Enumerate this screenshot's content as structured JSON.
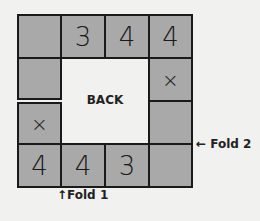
{
  "diagram": {
    "center_label": "BACK",
    "cells": [
      {
        "row": 0,
        "col": 0,
        "text": ""
      },
      {
        "row": 0,
        "col": 1,
        "text": "3"
      },
      {
        "row": 0,
        "col": 2,
        "text": "4"
      },
      {
        "row": 0,
        "col": 3,
        "text": "4"
      },
      {
        "row": 1,
        "col": 0,
        "text": ""
      },
      {
        "row": 1,
        "col": 3,
        "text": "×"
      },
      {
        "row": 2,
        "col": 0,
        "text": "×"
      },
      {
        "row": 2,
        "col": 3,
        "text": ""
      },
      {
        "row": 3,
        "col": 0,
        "text": "4"
      },
      {
        "row": 3,
        "col": 1,
        "text": "4"
      },
      {
        "row": 3,
        "col": 2,
        "text": "3"
      },
      {
        "row": 3,
        "col": 3,
        "text": ""
      }
    ],
    "fold1_label": "↑Fold 1",
    "fold2_label": "← Fold 2",
    "colors": {
      "cell_fill": "#a9a9a9",
      "border": "#1a1a1a",
      "background": "#f1f1f0"
    }
  }
}
